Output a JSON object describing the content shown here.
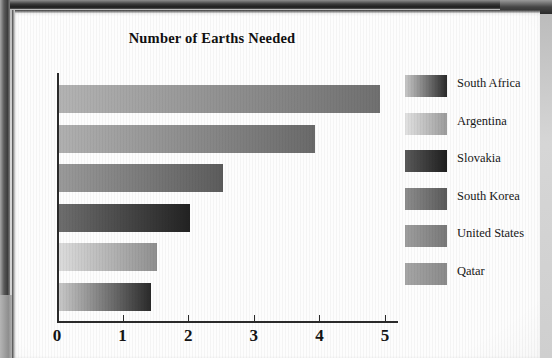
{
  "chart_data": {
    "type": "bar",
    "orientation": "horizontal",
    "title": "Number of Earths Needed",
    "xlabel": "",
    "ylabel": "",
    "xlim": [
      0,
      5
    ],
    "xticks": [
      "0",
      "1",
      "2",
      "3",
      "4",
      "5"
    ],
    "grid": false,
    "legend_position": "right",
    "categories": [
      "Qatar",
      "United States",
      "South Korea",
      "Slovakia",
      "Argentina",
      "South Africa"
    ],
    "values": [
      4.9,
      3.9,
      2.5,
      2.0,
      1.5,
      1.4
    ],
    "bars": [
      {
        "label": "Qatar",
        "value": 4.9,
        "color_from": "#b3b3b3",
        "color_to": "#707070"
      },
      {
        "label": "United States",
        "value": 3.9,
        "color_from": "#b0b0b0",
        "color_to": "#6a6a6a"
      },
      {
        "label": "South Korea",
        "value": 2.5,
        "color_from": "#9a9a9a",
        "color_to": "#5c5c5c"
      },
      {
        "label": "Slovakia",
        "value": 2.0,
        "color_from": "#6e6e6e",
        "color_to": "#222222"
      },
      {
        "label": "Argentina",
        "value": 1.5,
        "color_from": "#dcdcdc",
        "color_to": "#8f8f8f"
      },
      {
        "label": "South Africa",
        "value": 1.4,
        "color_from": "#c8c8c8",
        "color_to": "#2a2a2a"
      }
    ],
    "legend": [
      {
        "label": "South Africa",
        "color_from": "#c8c8c8",
        "color_to": "#2a2a2a"
      },
      {
        "label": "Argentina",
        "color_from": "#e2e2e2",
        "color_to": "#9b9b9b"
      },
      {
        "label": "Slovakia",
        "color_from": "#5a5a5a",
        "color_to": "#1e1e1e"
      },
      {
        "label": "South Korea",
        "color_from": "#8d8d8d",
        "color_to": "#5a5a5a"
      },
      {
        "label": "United States",
        "color_from": "#9e9e9e",
        "color_to": "#787878"
      },
      {
        "label": "Qatar",
        "color_from": "#a6a6a6",
        "color_to": "#8a8a8a"
      }
    ]
  }
}
